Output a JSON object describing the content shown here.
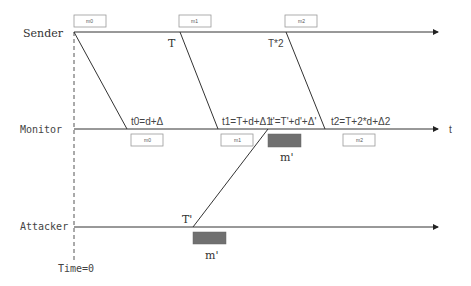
{
  "diagram": {
    "type": "timing-sequence",
    "lanes": [
      {
        "id": "sender",
        "label": "Sender"
      },
      {
        "id": "monitor",
        "label": "Monitor"
      },
      {
        "id": "attacker",
        "label": "Attacker"
      }
    ],
    "time_axis_label": "t",
    "origin_label": "Time=0",
    "sender_events": [
      {
        "msg": "m0",
        "time_label": ""
      },
      {
        "msg": "m1",
        "time_label": "T"
      },
      {
        "msg": "m2",
        "time_label": "T*2"
      }
    ],
    "monitor_events": [
      {
        "msg": "m0",
        "time_label": "t0=d+Δ"
      },
      {
        "msg": "m1",
        "time_label": "t1=T+d+Δ1"
      },
      {
        "msg": "m'",
        "time_label": "t'=T'+d'+Δ'",
        "forged": true
      },
      {
        "msg": "m2",
        "time_label": "t2=T+2*d+Δ2"
      }
    ],
    "attacker_events": [
      {
        "msg": "m'",
        "time_label": "T'"
      }
    ],
    "colors": {
      "line": "#333333",
      "forged_box": "#707070",
      "box_border": "#999999"
    }
  }
}
